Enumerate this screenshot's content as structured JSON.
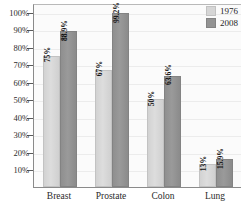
{
  "chart_data": {
    "type": "bar",
    "title": "",
    "xlabel": "",
    "ylabel": "",
    "categories": [
      "Breast",
      "Prostate",
      "Colon",
      "Lung"
    ],
    "ylim": [
      0,
      105
    ],
    "grid": true,
    "legend_position": "top-right",
    "y_ticks": [
      {
        "value": 100,
        "label": "100%"
      },
      {
        "value": 90,
        "label": "90%"
      },
      {
        "value": 80,
        "label": "80%"
      },
      {
        "value": 70,
        "label": "70%"
      },
      {
        "value": 60,
        "label": "60%"
      },
      {
        "value": 50,
        "label": "50%"
      },
      {
        "value": 40,
        "label": "40%"
      },
      {
        "value": 30,
        "label": "30%"
      },
      {
        "value": 20,
        "label": "20%"
      },
      {
        "value": 10,
        "label": "10%"
      }
    ],
    "series": [
      {
        "name": "1976",
        "color": "#d6d6d6",
        "values": [
          75,
          67,
          50,
          13
        ],
        "data_labels": [
          "75%",
          "67%",
          "50%",
          "13%"
        ]
      },
      {
        "name": "2008",
        "color": "#939393",
        "values": [
          88.9,
          99.2,
          63.6,
          15.9
        ],
        "data_labels": [
          "88.9%",
          "99.2%",
          "63.6%",
          "15.9%"
        ]
      }
    ]
  },
  "legend": {
    "items": [
      {
        "label": "1976"
      },
      {
        "label": "2008"
      }
    ]
  }
}
